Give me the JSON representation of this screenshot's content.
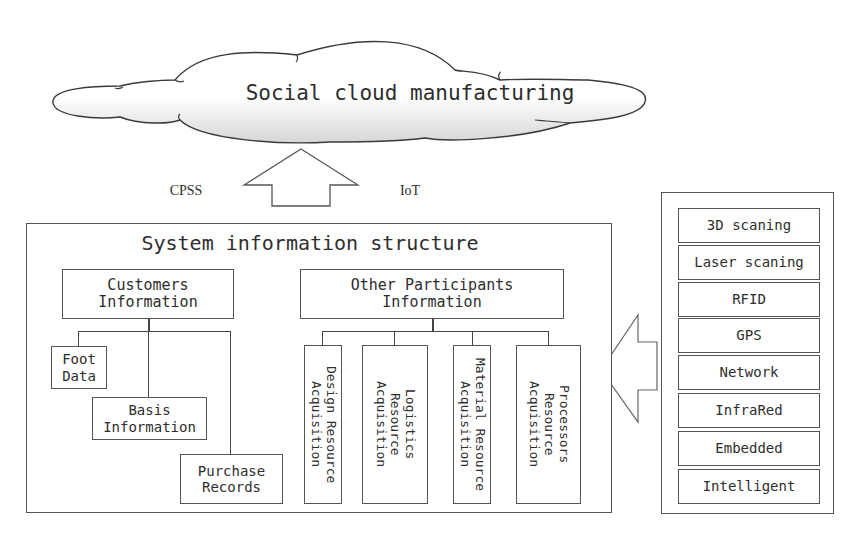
{
  "cloud": {
    "label": "Social cloud manufacturing"
  },
  "arrow_up": {
    "left_label": "CPSS",
    "right_label": "IoT"
  },
  "system_structure": {
    "title": "System information structure",
    "customers": {
      "label": "Customers Information",
      "children": [
        "Foot Data",
        "Basis Information",
        "Purchase Records"
      ]
    },
    "participants": {
      "label": "Other Participants Information",
      "children": [
        "Design Resource Acquisition",
        "Logistics Resource Acquisition",
        "Material Resource Acquisition",
        "Processors Resource Acquisition"
      ]
    }
  },
  "technologies": {
    "items": [
      "3D scaning",
      "Laser scaning",
      "RFID",
      "GPS",
      "Network",
      "InfraRed",
      "Embedded",
      "Intelligent"
    ]
  },
  "colors": {
    "stroke": "#444444",
    "background": "#ffffff",
    "cloud_shade": "#d9d9d9"
  }
}
